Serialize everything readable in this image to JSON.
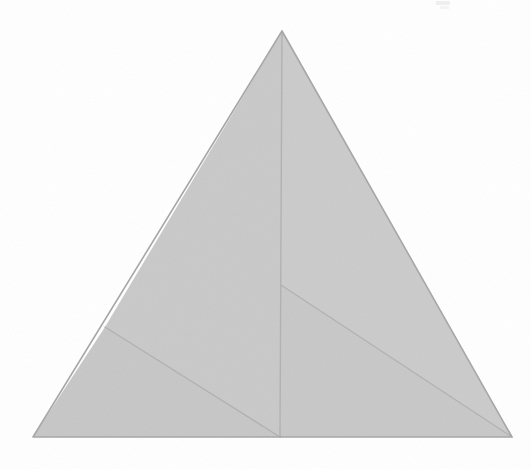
{
  "document": {
    "title": "Scanned geometric figure",
    "description": "Large shaded triangle subdivided by three internal fold lines, resembling the net of a tetrahedron or a pyramid projection.",
    "background_color": "#ffffff",
    "canvas_width": 531,
    "canvas_height": 469
  },
  "figure": {
    "name": "subdivided-triangle",
    "shape_type": "triangle",
    "fill_color": "#c9c9c9",
    "fill_color_secondary": "#cdcdcd",
    "outline_color": "#a8a8a8",
    "interior_line_color": "#b3b3b3",
    "outline_width": 1.6,
    "interior_line_width": 1.4,
    "vertices": {
      "apex": {
        "label": "apex",
        "x": 282,
        "y": 31
      },
      "bottom_left": {
        "label": "bottom-left",
        "x": 33,
        "y": 437
      },
      "bottom_right": {
        "label": "bottom-right",
        "x": 512,
        "y": 437
      },
      "base_mid": {
        "label": "base-midpoint",
        "x": 280,
        "y": 437
      },
      "left_edge_point": {
        "label": "left-edge-fold-point",
        "x": 105,
        "y": 327
      },
      "center_junction": {
        "label": "center-junction",
        "x": 281,
        "y": 285
      }
    },
    "outer_path": "M 282 31 L 512 437 L 33 437 Z",
    "regions": [
      {
        "name": "upper-left-panel",
        "path": "M 282 31 L 281 285 L 280 437 L 105 327 Z",
        "fill": "#cacaca"
      },
      {
        "name": "lower-left-panel",
        "path": "M 105 327 L 280 437 L 33 437 Z",
        "fill": "#c8c8c8"
      },
      {
        "name": "upper-right-panel",
        "path": "M 282 31 L 512 437 L 281 285 Z",
        "fill": "#cccccc"
      },
      {
        "name": "lower-right-panel",
        "path": "M 281 285 L 512 437 L 280 437 Z",
        "fill": "#c9c9c9"
      }
    ],
    "interior_lines": [
      {
        "name": "median-apex-to-base",
        "from": "apex",
        "to": "base_mid",
        "x1": 282,
        "y1": 31,
        "x2": 280,
        "y2": 437
      },
      {
        "name": "left-fold-line",
        "from": "left_edge_point",
        "to": "base_mid",
        "x1": 105,
        "y1": 327,
        "x2": 280,
        "y2": 437
      },
      {
        "name": "right-fold-line",
        "from": "center_junction",
        "to": "bottom_right",
        "x1": 281,
        "y1": 285,
        "x2": 512,
        "y2": 437
      }
    ],
    "edges": [
      {
        "name": "left-edge",
        "x1": 282,
        "y1": 31,
        "x2": 33,
        "y2": 437
      },
      {
        "name": "right-edge",
        "x1": 282,
        "y1": 31,
        "x2": 512,
        "y2": 437
      },
      {
        "name": "base-edge",
        "x1": 33,
        "y1": 437,
        "x2": 512,
        "y2": 437
      }
    ],
    "artifacts": [
      {
        "name": "top-right-scan-speck",
        "x": 436,
        "y": 1,
        "width": 14,
        "height": 4,
        "color": "#efefef"
      },
      {
        "name": "top-right-scan-smudge",
        "x": 440,
        "y": 6,
        "width": 9,
        "height": 3,
        "color": "#f4f4f4"
      }
    ]
  }
}
